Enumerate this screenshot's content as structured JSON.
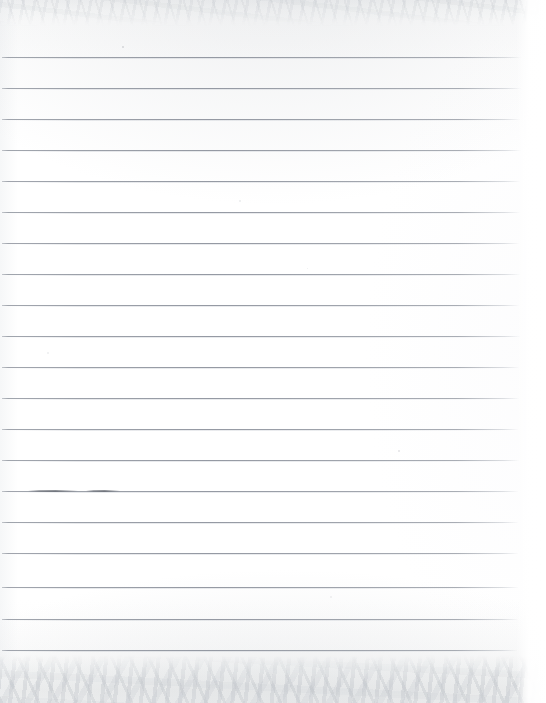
{
  "document": {
    "kind": "scanned-image",
    "subject": "blank ruled notebook paper",
    "caption": "Scanned blank sheet of wide-ruled lined paper",
    "width": 546,
    "height": 703,
    "text_content": "",
    "handwriting": "none"
  },
  "paper": {
    "background_color": "#ffffff",
    "rule_color": "#969ba4",
    "edge_shadow_color": "#eef0f1",
    "rule_count": 20,
    "first_rule_y": 57,
    "rule_spacing": 31.2,
    "rule_left_x": 2,
    "rule_right_x": 521,
    "top_band_height": 26,
    "bottom_band_height": 48,
    "right_margin_width": 30
  },
  "rules": [
    {
      "index": 1,
      "y": 57,
      "x1": 2,
      "x2": 521
    },
    {
      "index": 2,
      "y": 88,
      "x1": 2,
      "x2": 521
    },
    {
      "index": 3,
      "y": 119,
      "x1": 2,
      "x2": 520
    },
    {
      "index": 4,
      "y": 150,
      "x1": 2,
      "x2": 521
    },
    {
      "index": 5,
      "y": 181,
      "x1": 2,
      "x2": 520
    },
    {
      "index": 6,
      "y": 212,
      "x1": 2,
      "x2": 520
    },
    {
      "index": 7,
      "y": 243,
      "x1": 2,
      "x2": 519
    },
    {
      "index": 8,
      "y": 274,
      "x1": 2,
      "x2": 520
    },
    {
      "index": 9,
      "y": 305,
      "x1": 2,
      "x2": 519
    },
    {
      "index": 10,
      "y": 336,
      "x1": 2,
      "x2": 520
    },
    {
      "index": 11,
      "y": 367,
      "x1": 2,
      "x2": 519
    },
    {
      "index": 12,
      "y": 398,
      "x1": 2,
      "x2": 519
    },
    {
      "index": 13,
      "y": 429,
      "x1": 2,
      "x2": 518
    },
    {
      "index": 14,
      "y": 460,
      "x1": 2,
      "x2": 519
    },
    {
      "index": 15,
      "y": 491,
      "x1": 2,
      "x2": 518
    },
    {
      "index": 16,
      "y": 522,
      "x1": 2,
      "x2": 518
    },
    {
      "index": 17,
      "y": 553,
      "x1": 2,
      "x2": 518
    },
    {
      "index": 18,
      "y": 587,
      "x1": 2,
      "x2": 518
    },
    {
      "index": 19,
      "y": 619,
      "x1": 2,
      "x2": 518
    },
    {
      "index": 20,
      "y": 650,
      "x1": 2,
      "x2": 517
    }
  ],
  "marks": [
    {
      "name": "graphite-smudge-left",
      "x": 28,
      "y": 490,
      "width": 50,
      "label": "faint darker segment on rule 15"
    },
    {
      "name": "graphite-smudge-right",
      "x": 86,
      "y": 490,
      "width": 34,
      "label": "faint darker segment on rule 15"
    }
  ],
  "specks": [
    {
      "x": 122,
      "y": 46,
      "size": 2,
      "opacity": 0.3
    },
    {
      "x": 398,
      "y": 450,
      "size": 2,
      "opacity": 0.22
    },
    {
      "x": 239,
      "y": 200,
      "size": 2,
      "opacity": 0.16
    },
    {
      "x": 47,
      "y": 352,
      "size": 2,
      "opacity": 0.14
    },
    {
      "x": 330,
      "y": 596,
      "size": 2,
      "opacity": 0.13
    },
    {
      "x": 307,
      "y": 268,
      "size": 1,
      "opacity": 0.14
    }
  ]
}
